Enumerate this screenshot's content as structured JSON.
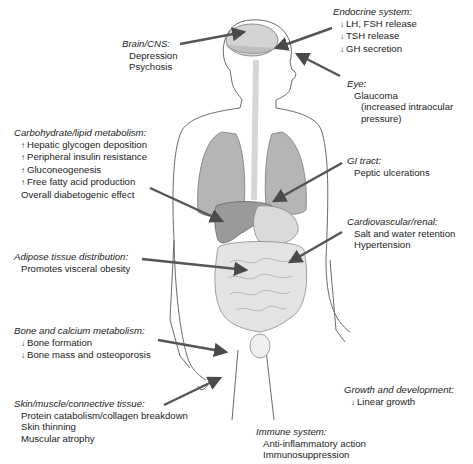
{
  "diagram": {
    "colors": {
      "outline": "#6a6a6a",
      "organ_fill": "#bdbdbd",
      "organ_dark": "#8f8f8f",
      "gut_fill": "#e2e2e2",
      "arrow": "#555555"
    },
    "groups": [
      {
        "id": "brain",
        "title": "Brain/CNS:",
        "items": [
          {
            "arrow": "",
            "text": "Depression"
          },
          {
            "arrow": "",
            "text": "Psychosis"
          }
        ]
      },
      {
        "id": "endocrine",
        "title": "Endocrine system:",
        "items": [
          {
            "arrow": "↓",
            "text": "LH, FSH release"
          },
          {
            "arrow": "↓",
            "text": "TSH release"
          },
          {
            "arrow": "↓",
            "text": "GH secretion"
          }
        ]
      },
      {
        "id": "eye",
        "title": "Eye:",
        "items": [
          {
            "arrow": "",
            "text": "Glaucoma"
          },
          {
            "arrow": "",
            "text": "(increased intraocular"
          },
          {
            "arrow": "",
            "text": "pressure)"
          }
        ]
      },
      {
        "id": "carb",
        "title": "Carbohydrate/lipid metabolism:",
        "items": [
          {
            "arrow": "↑",
            "text": "Hepatic glycogen deposition"
          },
          {
            "arrow": "↑",
            "text": "Peripheral insulin resistance"
          },
          {
            "arrow": "↑",
            "text": "Gluconeogenesis"
          },
          {
            "arrow": "↑",
            "text": "Free fatty acid production"
          },
          {
            "arrow": "",
            "text": "Overall diabetogenic effect"
          }
        ]
      },
      {
        "id": "gi",
        "title": "GI tract:",
        "items": [
          {
            "arrow": "",
            "text": "Peptic ulcerations"
          }
        ]
      },
      {
        "id": "cardio",
        "title": "Cardiovascular/renal:",
        "items": [
          {
            "arrow": "",
            "text": "Salt and water retention"
          },
          {
            "arrow": "",
            "text": "Hypertension"
          }
        ]
      },
      {
        "id": "adipose",
        "title": "Adipose tissue distribution:",
        "items": [
          {
            "arrow": "",
            "text": "Promotes visceral obesity"
          }
        ]
      },
      {
        "id": "bone",
        "title": "Bone and calcium metabolism:",
        "items": [
          {
            "arrow": "↓",
            "text": "Bone formation"
          },
          {
            "arrow": "↓",
            "text": "Bone mass and osteoporosis"
          }
        ]
      },
      {
        "id": "growth",
        "title": "Growth and development:",
        "items": [
          {
            "arrow": "↓",
            "text": "Linear growth"
          }
        ]
      },
      {
        "id": "skin",
        "title": "Skin/muscle/connective tissue:",
        "items": [
          {
            "arrow": "",
            "text": "Protein catabolism/collagen breakdown"
          },
          {
            "arrow": "",
            "text": "Skin thinning"
          },
          {
            "arrow": "",
            "text": "Muscular atrophy"
          }
        ]
      },
      {
        "id": "immune",
        "title": "Immune system:",
        "items": [
          {
            "arrow": "",
            "text": "Anti-inflammatory action"
          },
          {
            "arrow": "",
            "text": "Immunosuppression"
          }
        ]
      }
    ]
  }
}
